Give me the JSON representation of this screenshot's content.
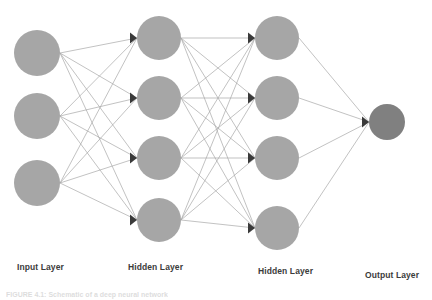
{
  "figure": {
    "type": "neural-network-diagram",
    "width": 432,
    "height": 300,
    "background": "#ffffff",
    "caption": "FIGURE 4.1:  Schematic of a deep neural network"
  },
  "colors": {
    "node_fill": "#a6a6a6",
    "node_fill_output": "#808080",
    "edge_stroke": "#a8a8a8",
    "arrowhead_fill": "#3a3a3a",
    "label_color": "#3b3b3b"
  },
  "labels": {
    "input": "Input Layer",
    "hidden1": "Hidden Layer",
    "hidden2": "Hidden Layer",
    "output": "Output Layer"
  },
  "label_positions": {
    "input": {
      "x": 17,
      "y": 262
    },
    "hidden1": {
      "x": 128,
      "y": 262
    },
    "hidden2": {
      "x": 258,
      "y": 266
    },
    "output": {
      "x": 365,
      "y": 270
    }
  },
  "chart_data": {
    "type": "diagram",
    "layers": [
      {
        "name": "Input Layer",
        "kind": "input",
        "node_count": 3,
        "x": 37,
        "radius": 23,
        "fill": "#a6a6a6",
        "nodes_y": [
          53,
          116,
          183
        ]
      },
      {
        "name": "Hidden Layer",
        "kind": "hidden",
        "node_count": 4,
        "x": 159,
        "radius": 22,
        "fill": "#a6a6a6",
        "nodes_y": [
          38,
          98,
          158,
          220
        ]
      },
      {
        "name": "Hidden Layer",
        "kind": "hidden",
        "node_count": 4,
        "x": 277,
        "radius": 22,
        "fill": "#a6a6a6",
        "nodes_y": [
          38,
          98,
          158,
          228
        ]
      },
      {
        "name": "Output Layer",
        "kind": "output",
        "node_count": 1,
        "x": 387,
        "radius": 18,
        "fill": "#808080",
        "nodes_y": [
          122
        ]
      }
    ],
    "connections": "fully-connected between consecutive layers",
    "edge_counts": [
      12,
      16,
      4
    ],
    "directed": true,
    "arrowhead": "filled triangle at target node"
  }
}
